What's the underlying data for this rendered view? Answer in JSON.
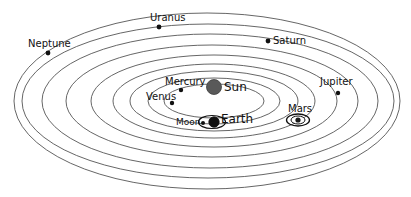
{
  "diagram": {
    "type": "schematic",
    "background_color": "#ffffff",
    "orbit_stroke_color": "#555555",
    "label_color": "#111111",
    "sun_color": "#595959",
    "planet_dot_color": "#111111",
    "canvas": {
      "width": 411,
      "height": 197
    },
    "center": {
      "x": 214,
      "y": 101
    }
  },
  "orbits": [
    {
      "name": "mercury-orbit",
      "rx": 50,
      "ry": 17
    },
    {
      "name": "venus-orbit",
      "rx": 66,
      "ry": 23
    },
    {
      "name": "earth-orbit",
      "rx": 84,
      "ry": 30
    },
    {
      "name": "mars-orbit",
      "rx": 101,
      "ry": 37
    },
    {
      "name": "jupiter-orbit",
      "rx": 123,
      "ry": 46
    },
    {
      "name": "saturn-orbit",
      "rx": 146,
      "ry": 56
    },
    {
      "name": "uranus-orbit",
      "rx": 168,
      "ry": 67
    },
    {
      "name": "neptune-orbit",
      "rx": 191,
      "ry": 78
    },
    {
      "name": "outer-orbit",
      "rx": 199,
      "ry": 88
    }
  ],
  "bodies": {
    "sun": {
      "label": "Sun",
      "cx": 214,
      "cy": 87,
      "r": 7.5,
      "label_x": 224,
      "label_y": 81,
      "label_size": "label-lg"
    },
    "mercury": {
      "label": "Mercury",
      "cx": 181,
      "cy": 90,
      "r": 2.2,
      "label_x": 165,
      "label_y": 77,
      "label_size": "label-md"
    },
    "venus": {
      "label": "Venus",
      "cx": 172,
      "cy": 103,
      "r": 2.2,
      "label_x": 146,
      "label_y": 92,
      "label_size": "label-md"
    },
    "earth": {
      "label": "Earth",
      "cx": 214,
      "cy": 122,
      "r": 5.2,
      "label_x": 221,
      "label_y": 113,
      "label_size": "label-lg"
    },
    "moon": {
      "label": "Moon",
      "cx": 203,
      "cy": 123,
      "r": 2.0,
      "label_x": 176,
      "label_y": 118,
      "label_size": "label-sm",
      "orbit_rx": 13.5,
      "orbit_ry": 6.5,
      "orbit_cx": 212,
      "orbit_cy": 122
    },
    "mars": {
      "label": "Mars",
      "cx": 298,
      "cy": 120,
      "r": 2.6,
      "label_x": 288,
      "label_y": 104,
      "label_size": "label-md",
      "ring_outer_rx": 11.5,
      "ring_outer_ry": 6.0,
      "ring_inner_rx": 7.0,
      "ring_inner_ry": 4.0
    },
    "jupiter": {
      "label": "Jupiter",
      "cx": 338,
      "cy": 93,
      "r": 2.2,
      "label_x": 320,
      "label_y": 77,
      "label_size": "label-md"
    },
    "saturn": {
      "label": "Saturn",
      "cx": 268,
      "cy": 41,
      "r": 2.4,
      "label_x": 273,
      "label_y": 36,
      "label_size": "label-md"
    },
    "uranus": {
      "label": "Uranus",
      "cx": 159,
      "cy": 27,
      "r": 2.4,
      "label_x": 150,
      "label_y": 13,
      "label_size": "label-md"
    },
    "neptune": {
      "label": "Neptune",
      "cx": 48,
      "cy": 53,
      "r": 2.4,
      "label_x": 28,
      "label_y": 39,
      "label_size": "label-md"
    }
  }
}
